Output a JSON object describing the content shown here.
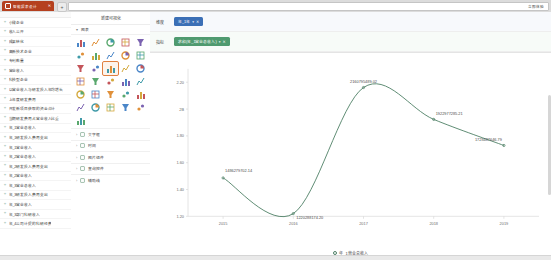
{
  "browser": {
    "tab_title": "智能报表设计",
    "tab_close": "✕",
    "new_tab": "+",
    "address_right_label": "立即体验"
  },
  "field_pane": {
    "items": [
      {
        "icon": "abc-icon",
        "label": "小微企业"
      },
      {
        "icon": "abc-icon",
        "label": "收入公开"
      },
      {
        "icon": "abc-icon",
        "label": "成果转化"
      },
      {
        "icon": "abc-icon",
        "label": "高新技术企业"
      },
      {
        "icon": "abc-icon",
        "label": "专利数量"
      },
      {
        "icon": "abc-icon",
        "label": "营业收入"
      },
      {
        "icon": "abc-icon",
        "label": "科技型企业"
      },
      {
        "icon": "abc-icon",
        "label": "以营业收入与研发投入年均增长"
      },
      {
        "icon": "abc-icon",
        "label": "上年度研发费用"
      },
      {
        "icon": "abc-icon",
        "label": "开发新项目获取的资金合计"
      },
      {
        "icon": "abc-icon",
        "label": "当期研发费用占营业收入比重"
      },
      {
        "icon": "abc-icon",
        "label": "年_1营业总收入"
      },
      {
        "icon": "abc-icon",
        "label": "年_1研发投入费用支出"
      },
      {
        "icon": "abc-icon",
        "label": "年_1营业收入"
      },
      {
        "icon": "abc-icon",
        "label": "年_2营业总收入"
      },
      {
        "icon": "abc-icon",
        "label": "年_2研发投入费用支出"
      },
      {
        "icon": "abc-icon",
        "label": "年_2营业收入"
      },
      {
        "icon": "abc-icon",
        "label": "年_3营业总收入"
      },
      {
        "icon": "abc-icon",
        "label": "年_3研发投入费用支出"
      },
      {
        "icon": "abc-icon",
        "label": "年_3营业收入"
      },
      {
        "icon": "abc-icon",
        "label": "年_3部门科研收入"
      },
      {
        "icon": "abc-icon",
        "label": "年_4公司计提的科研经费"
      }
    ]
  },
  "type_pane": {
    "title": "新建可视化",
    "group_label": "图表",
    "group_chevron": "▾",
    "icons": [
      {
        "name": "bar-chart-icon",
        "selected": false
      },
      {
        "name": "area-chart-icon",
        "selected": false
      },
      {
        "name": "column-chart-icon",
        "selected": false
      },
      {
        "name": "stacked-bar-icon",
        "selected": false
      },
      {
        "name": "histogram-icon",
        "selected": false
      },
      {
        "name": "hbar-chart-icon",
        "selected": false
      },
      {
        "name": "people-chart-icon",
        "selected": false
      },
      {
        "name": "gauge-chart-icon",
        "selected": false
      },
      {
        "name": "donut-chart-icon",
        "selected": false
      },
      {
        "name": "pie-chart-icon",
        "selected": false
      },
      {
        "name": "bubble-chart-icon",
        "selected": false
      },
      {
        "name": "scatter-chart-icon",
        "selected": false
      },
      {
        "name": "line-chart-icon",
        "selected": true
      },
      {
        "name": "radar-chart-icon",
        "selected": false
      },
      {
        "name": "leaf-chart-icon",
        "selected": false
      },
      {
        "name": "tree-chart-icon",
        "selected": false
      },
      {
        "name": "funnel-icon",
        "selected": false
      },
      {
        "name": "flag-chart-icon",
        "selected": false
      },
      {
        "name": "spark-line-icon",
        "selected": false
      },
      {
        "name": "map-pin-icon",
        "selected": false
      },
      {
        "name": "curve-chart-icon",
        "selected": false
      },
      {
        "name": "target-chart-icon",
        "selected": false
      },
      {
        "name": "table-grid-icon",
        "selected": false
      },
      {
        "name": "matrix-icon",
        "selected": false
      },
      {
        "name": "kpi-card-icon",
        "selected": false
      },
      {
        "name": "filter-chart-icon",
        "selected": false
      },
      {
        "name": "star-chart-icon",
        "selected": false
      },
      {
        "name": "funnel-filter-icon",
        "selected": false
      },
      {
        "name": "sankey-icon",
        "selected": false
      },
      {
        "name": "heatmap-icon",
        "selected": false
      },
      {
        "name": "mixed-chart-icon",
        "selected": false
      }
    ],
    "sections": [
      {
        "chevron": "›",
        "icon": "text-icon",
        "label": "文字框"
      },
      {
        "chevron": "›",
        "icon": "clock-icon",
        "label": "时间"
      },
      {
        "chevron": "›",
        "icon": "image-icon",
        "label": "图片组件"
      },
      {
        "chevron": "›",
        "icon": "shape-icon",
        "label": "查询控件"
      },
      {
        "chevron": "›",
        "icon": "grid-icon",
        "label": "辅助线"
      }
    ]
  },
  "filters": {
    "rows": [
      {
        "label": "维度",
        "pill_text": "年_1年",
        "caret": "▾",
        "close": "✕",
        "color": "#3b6fb6"
      },
      {
        "label": "指标",
        "pill_text": "求和(年_1营业总收入)",
        "caret": "▾",
        "close": "✕",
        "color": "#4f9a6f"
      }
    ]
  },
  "chart_data": {
    "type": "line",
    "title": "",
    "xlabel": "",
    "ylabel": "",
    "categories": [
      "2015",
      "2016",
      "2017",
      "2018",
      "2019"
    ],
    "x_tick_labels": [
      "2015",
      "2016",
      "2017",
      "2018",
      "2019"
    ],
    "y_tick_labels": [
      "2.20",
      "2B",
      "1.80",
      "1.60",
      "1.40",
      "1.20"
    ],
    "y_tick_values": [
      2.2,
      2.0,
      1.8,
      1.6,
      1.4,
      1.2
    ],
    "ylim": [
      1.2,
      2.3
    ],
    "grid": false,
    "legend_position": "bottom",
    "series": [
      {
        "name": "年_1营业总收入",
        "color": "#4d7f65",
        "values": [
          1486279702.14,
          1220288174.2,
          2160795489.02,
          1922977285.21,
          1728487646.79
        ],
        "point_labels": [
          "1486279702.14",
          "1220288174.20",
          "2160795489.02",
          "1922977285.21",
          "1728487646.79"
        ]
      }
    ],
    "legend": [
      {
        "marker": "circle-outline",
        "label": "年_1营业总收入",
        "color": "#4d7f65"
      }
    ]
  }
}
